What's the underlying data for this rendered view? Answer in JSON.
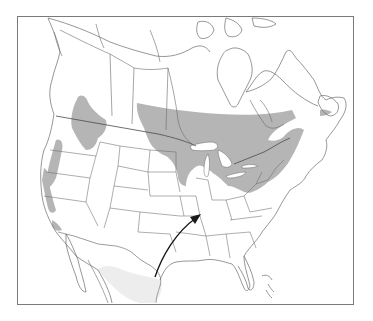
{
  "map": {
    "subject": "North America range map",
    "frame": {
      "x": 17,
      "y": 16,
      "width": 336,
      "height": 288
    },
    "colors": {
      "background": "#ffffff",
      "frame": "#7a7a7a",
      "borders": "#5a5a5a",
      "coast": "#6a6a6a",
      "range_fill": "#b5b5b5",
      "range_fill_faint": "#ececec",
      "arrow": "#1a1a1a"
    },
    "legend": [],
    "labels": [],
    "regions": [
      {
        "name": "boreal-range",
        "description": "Shaded band across southern Canada, Great Lakes and New England"
      },
      {
        "name": "western-range",
        "description": "Shaded patches in Pacific Northwest, BC, Idaho/Montana Rockies, Sierra Nevada"
      },
      {
        "name": "newfoundland-patch",
        "description": "Small shaded patch on southwest Newfoundland"
      },
      {
        "name": "mexico-faint",
        "description": "Faint lighter shading in northeastern Mexico"
      }
    ],
    "annotation": {
      "type": "arrow",
      "from": "south Texas coast",
      "to": "southern Illinois / Kentucky area",
      "direction": "northeast"
    }
  }
}
